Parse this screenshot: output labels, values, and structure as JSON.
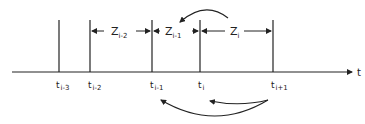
{
  "diagram": {
    "axis": {
      "label": "t"
    },
    "ticks": [
      {
        "name": "t",
        "sub": "i-3"
      },
      {
        "name": "t",
        "sub": "i-2"
      },
      {
        "name": "t",
        "sub": "i-1"
      },
      {
        "name": "t",
        "sub": "i"
      },
      {
        "name": "t",
        "sub": "i+1"
      }
    ],
    "intervals": [
      {
        "name": "Z",
        "sub": "i-2"
      },
      {
        "name": "Z",
        "sub": "i-1"
      },
      {
        "name": "Z",
        "sub": "i"
      }
    ],
    "colors": {
      "ink": "#222222",
      "background": "#ffffff"
    }
  }
}
